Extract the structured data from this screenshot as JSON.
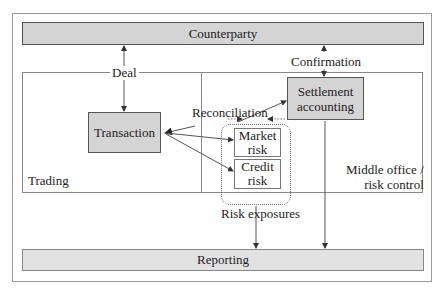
{
  "diagram": {
    "nodes": {
      "counterparty": "Counterparty",
      "transaction": "Transaction",
      "settlement_line1": "Settlement",
      "settlement_line2": "accounting",
      "market_risk_line1": "Market",
      "market_risk_line2": "risk",
      "credit_risk_line1": "Credit",
      "credit_risk_line2": "risk",
      "reporting": "Reporting"
    },
    "regions": {
      "trading": "Trading",
      "middle_office_line1": "Middle office /",
      "middle_office_line2": "risk control"
    },
    "edge_labels": {
      "deal": "Deal",
      "confirmation": "Confirmation",
      "reconciliation": "Reconciliation",
      "risk_exposures": "Risk exposures"
    },
    "colors": {
      "box_fill": "#d4d4d4",
      "box_border": "#555555",
      "line": "#555555"
    }
  }
}
